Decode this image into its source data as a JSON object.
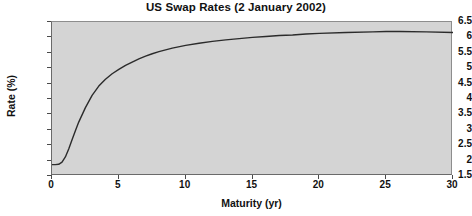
{
  "chart_data": {
    "type": "line",
    "title": "US Swap Rates (2 January 2002)",
    "xlabel": "Maturity (yr)",
    "ylabel": "Rate (%)",
    "xlim": [
      0,
      30
    ],
    "ylim": [
      1.5,
      6.5
    ],
    "xticks": [
      0,
      5,
      10,
      15,
      20,
      25,
      30
    ],
    "xtick_labels": [
      "0",
      "5",
      "10",
      "15",
      "20",
      "25",
      "30"
    ],
    "yticks": [
      1.5,
      2,
      2.5,
      3,
      3.5,
      4,
      4.5,
      5,
      5.5,
      6,
      6.5
    ],
    "ytick_labels": [
      "1.5",
      "2",
      "2.5",
      "3",
      "3.5",
      "4",
      "4.5",
      "5",
      "5.5",
      "6",
      "6.5"
    ],
    "grid": false,
    "legend": null,
    "plot_background": "#d4d4d4",
    "line_color": "#2b2b2b",
    "series": [
      {
        "name": "US swap rate curve",
        "x": [
          0.0,
          0.25,
          0.5,
          0.75,
          1.0,
          1.25,
          1.5,
          1.75,
          2.0,
          2.5,
          3.0,
          3.5,
          4.0,
          4.5,
          5.0,
          5.5,
          6.0,
          6.5,
          7.0,
          7.5,
          8.0,
          9.0,
          10.0,
          11.0,
          12.0,
          13.0,
          14.0,
          15.0,
          16.0,
          17.0,
          18.0,
          19.0,
          20.0,
          22.0,
          24.0,
          25.0,
          26.0,
          28.0,
          30.0
        ],
        "y": [
          1.87,
          1.87,
          1.88,
          1.95,
          2.12,
          2.38,
          2.68,
          2.97,
          3.25,
          3.72,
          4.12,
          4.42,
          4.64,
          4.82,
          4.96,
          5.09,
          5.2,
          5.3,
          5.39,
          5.47,
          5.54,
          5.65,
          5.74,
          5.81,
          5.87,
          5.92,
          5.96,
          6.0,
          6.03,
          6.06,
          6.08,
          6.11,
          6.13,
          6.16,
          6.18,
          6.19,
          6.19,
          6.18,
          6.16
        ]
      }
    ]
  }
}
